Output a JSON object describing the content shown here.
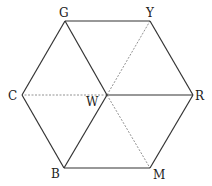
{
  "diagram": {
    "vertices": [
      {
        "id": "G",
        "label": "G",
        "x": 65,
        "y": 21,
        "lx": 59,
        "ly": 17
      },
      {
        "id": "Y",
        "label": "Y",
        "x": 150,
        "y": 21,
        "lx": 146,
        "ly": 17
      },
      {
        "id": "C",
        "label": "C",
        "x": 22,
        "y": 95,
        "lx": 8,
        "ly": 100
      },
      {
        "id": "R",
        "label": "R",
        "x": 193,
        "y": 95,
        "lx": 195,
        "ly": 100
      },
      {
        "id": "B",
        "label": "B",
        "x": 64,
        "y": 168,
        "lx": 51,
        "ly": 178
      },
      {
        "id": "M",
        "label": "M",
        "x": 150,
        "y": 168,
        "lx": 153,
        "ly": 179
      },
      {
        "id": "W",
        "label": "W",
        "x": 107,
        "y": 95,
        "lx": 86,
        "ly": 106
      }
    ],
    "edges_solid": [
      [
        "G",
        "Y"
      ],
      [
        "Y",
        "R"
      ],
      [
        "R",
        "M"
      ],
      [
        "M",
        "B"
      ],
      [
        "B",
        "C"
      ],
      [
        "C",
        "G"
      ],
      [
        "W",
        "G"
      ],
      [
        "W",
        "R"
      ],
      [
        "W",
        "B"
      ]
    ],
    "edges_dashed": [
      [
        "W",
        "C"
      ],
      [
        "W",
        "Y"
      ],
      [
        "W",
        "M"
      ]
    ],
    "stroke_color": "#333333",
    "dash_color": "#777777"
  }
}
